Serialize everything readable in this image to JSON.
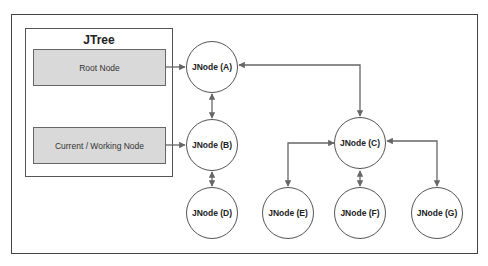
{
  "diagram": {
    "jtree": {
      "title": "JTree",
      "items": [
        {
          "label": "Root Node"
        },
        {
          "label": "Current / Working Node"
        }
      ]
    },
    "nodes": {
      "A": {
        "label": "JNode (A)"
      },
      "B": {
        "label": "JNode (B)"
      },
      "C": {
        "label": "JNode (C)"
      },
      "D": {
        "label": "JNode (D)"
      },
      "E": {
        "label": "JNode (E)"
      },
      "F": {
        "label": "JNode (F)"
      },
      "G": {
        "label": "JNode (G)"
      }
    },
    "edges": [
      {
        "from": "Root Node",
        "to": "JNode (A)",
        "type": "directed"
      },
      {
        "from": "Current / Working Node",
        "to": "JNode (B)",
        "type": "directed"
      },
      {
        "from": "JNode (A)",
        "to": "JNode (B)",
        "type": "bidirectional"
      },
      {
        "from": "JNode (B)",
        "to": "JNode (D)",
        "type": "bidirectional"
      },
      {
        "from": "JNode (A)",
        "to": "JNode (C)",
        "type": "bidirectional"
      },
      {
        "from": "JNode (C)",
        "to": "JNode (E)",
        "type": "bidirectional"
      },
      {
        "from": "JNode (C)",
        "to": "JNode (F)",
        "type": "bidirectional"
      },
      {
        "from": "JNode (C)",
        "to": "JNode (G)",
        "type": "bidirectional"
      }
    ],
    "colors": {
      "line": "#666666",
      "box_fill": "#d9d9d9",
      "border": "#444444"
    }
  }
}
